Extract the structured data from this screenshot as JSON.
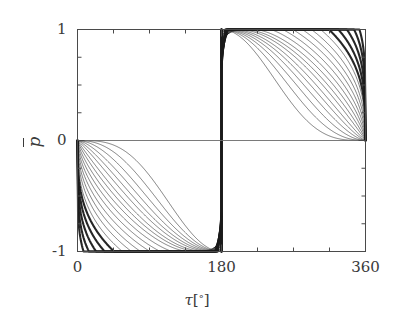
{
  "chart_data": {
    "type": "line",
    "title": "",
    "xlabel": "τ [°]",
    "ylabel": "p̄",
    "xlim": [
      0,
      360
    ],
    "ylim": [
      -1,
      1
    ],
    "x_major_ticks": [
      0,
      180,
      360
    ],
    "x_major_tick_labels": [
      "0",
      "180",
      "360"
    ],
    "x_minor_tick_step": 45,
    "y_major_ticks": [
      -1,
      0,
      1
    ],
    "y_major_tick_labels": [
      "-1",
      "0",
      "1"
    ],
    "y_minor_tick_step": 0.25,
    "grid": false,
    "legend": "none",
    "frame": "box",
    "tick_direction": "in",
    "series": [
      {
        "name": "curve-01",
        "shape_exponent": 0.3,
        "weight": "thin",
        "min_value": -1,
        "max_value": 1,
        "min_at": 172,
        "max_at": 188
      },
      {
        "name": "curve-02",
        "shape_exponent": 0.42,
        "weight": "thin",
        "min_value": -1,
        "max_value": 1,
        "min_at": 170,
        "max_at": 190
      },
      {
        "name": "curve-03",
        "shape_exponent": 0.54,
        "weight": "thin",
        "min_value": -1,
        "max_value": 1,
        "min_at": 168,
        "max_at": 192
      },
      {
        "name": "curve-04",
        "shape_exponent": 0.66,
        "weight": "thin",
        "min_value": -1,
        "max_value": 1,
        "min_at": 166,
        "max_at": 194
      },
      {
        "name": "curve-05",
        "shape_exponent": 0.78,
        "weight": "thin",
        "min_value": -1,
        "max_value": 1,
        "min_at": 164,
        "max_at": 196
      },
      {
        "name": "curve-06",
        "shape_exponent": 0.9,
        "weight": "thin",
        "min_value": -1,
        "max_value": 1,
        "min_at": 162,
        "max_at": 198
      },
      {
        "name": "curve-07",
        "shape_exponent": 1.05,
        "weight": "thin",
        "min_value": -1,
        "max_value": 1,
        "min_at": 160,
        "max_at": 200
      },
      {
        "name": "curve-08",
        "shape_exponent": 1.2,
        "weight": "thin",
        "min_value": -1,
        "max_value": 1,
        "min_at": 157,
        "max_at": 203
      },
      {
        "name": "curve-09",
        "shape_exponent": 1.38,
        "weight": "thin",
        "min_value": -1,
        "max_value": 1,
        "min_at": 154,
        "max_at": 206
      },
      {
        "name": "curve-10",
        "shape_exponent": 1.56,
        "weight": "thin",
        "min_value": -1,
        "max_value": 1,
        "min_at": 151,
        "max_at": 209
      },
      {
        "name": "curve-11",
        "shape_exponent": 1.76,
        "weight": "thin",
        "min_value": -1,
        "max_value": 1,
        "min_at": 148,
        "max_at": 212
      },
      {
        "name": "curve-12",
        "shape_exponent": 1.98,
        "weight": "thin",
        "min_value": -1,
        "max_value": 1,
        "min_at": 145,
        "max_at": 215
      },
      {
        "name": "curve-13",
        "shape_exponent": 2.22,
        "weight": "thin",
        "min_value": -1,
        "max_value": 1,
        "min_at": 141,
        "max_at": 219
      },
      {
        "name": "curve-14",
        "shape_exponent": 2.48,
        "weight": "thin",
        "min_value": -1,
        "max_value": 1,
        "min_at": 138,
        "max_at": 222
      },
      {
        "name": "curve-15",
        "shape_exponent": 2.78,
        "weight": "thin",
        "min_value": -1,
        "max_value": 1,
        "min_at": 134,
        "max_at": 226
      },
      {
        "name": "curve-16",
        "shape_exponent": 3.1,
        "weight": "bold",
        "min_value": -1,
        "max_value": 1,
        "min_at": 130,
        "max_at": 230
      },
      {
        "name": "curve-17",
        "shape_exponent": 3.55,
        "weight": "bold",
        "min_value": -1,
        "max_value": 1,
        "min_at": 125,
        "max_at": 235
      },
      {
        "name": "curve-18",
        "shape_exponent": 4.1,
        "weight": "bold",
        "min_value": -1,
        "max_value": 1,
        "min_at": 119,
        "max_at": 241
      },
      {
        "name": "curve-19",
        "shape_exponent": 4.8,
        "weight": "bold",
        "min_value": -1,
        "max_value": 1,
        "min_at": 113,
        "max_at": 247
      },
      {
        "name": "curve-20",
        "shape_exponent": 5.7,
        "weight": "bold",
        "min_value": -1,
        "max_value": 1,
        "min_at": 106,
        "max_at": 254
      }
    ],
    "zero_line": {
      "y": 0,
      "from_x": 0,
      "to_x": 360
    }
  },
  "axes": {
    "x_labels": [
      "0",
      "180",
      "360"
    ],
    "y_labels": [
      "1",
      "0",
      "-1"
    ],
    "x_title_tau": "τ",
    "x_title_bracket_open": "[",
    "x_title_degree": "°",
    "x_title_bracket_close": "]",
    "y_title_symbol": "p"
  },
  "style": {
    "axis_color": "#4a4a4a",
    "curve_color": "#1a1a1a",
    "background": "#ffffff",
    "zero_line_color": "#6b6b6b"
  }
}
